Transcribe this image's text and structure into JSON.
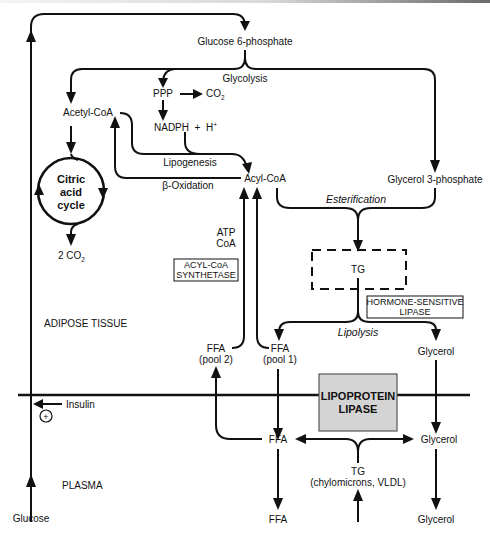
{
  "diagram": {
    "compartments": {
      "adipose": "ADIPOSE TISSUE",
      "plasma": "PLASMA"
    },
    "nodes": {
      "glucose6p": "Glucose 6-phosphate",
      "glycolysis": "Glycolysis",
      "ppp": "PPP",
      "co2_ppp": "CO",
      "co2_sub": "2",
      "nadph": "NADPH  +  H",
      "nadph_sup": "+",
      "acetylcoa": "Acetyl-CoA",
      "lipogenesis": "Lipogenesis",
      "beta_oxidation": "β-Oxidation",
      "acylcoa": "Acyl-CoA",
      "citric_line1": "Citric",
      "citric_line2": "acid",
      "citric_line3": "cycle",
      "two_co2": "2 CO",
      "two_co2_sub": "2",
      "glycerol3p": "Glycerol 3-phosphate",
      "esterification": "Esterification",
      "tg_tissue": "TG",
      "atp": "ATP",
      "coa": "CoA",
      "acyl_synth_line1": "ACYL-CoA",
      "acyl_synth_line2": "SYNTHETASE",
      "hsl_line1": "HORMONE-SENSITIVE",
      "hsl_line2": "LIPASE",
      "lipolysis": "Lipolysis",
      "ffa_pool2": "FFA",
      "pool2": "(pool 2)",
      "ffa_pool1": "FFA",
      "pool1": "(pool 1)",
      "glycerol_tissue": "Glycerol",
      "lpl_line1": "LIPOPROTEIN",
      "lpl_line2": "LIPASE",
      "insulin": "Insulin",
      "insulin_effect": "+",
      "ffa_plasma": "FFA",
      "glycerol_plasma": "Glycerol",
      "tg_plasma": "TG",
      "tg_plasma_src": "(chylomicrons, VLDL)",
      "ffa_out": "FFA",
      "glycerol_out": "Glycerol",
      "glucose": "Glucose"
    },
    "colors": {
      "line": "#111111",
      "lpl_fill": "#d4d4d4",
      "background": "#ffffff"
    }
  }
}
